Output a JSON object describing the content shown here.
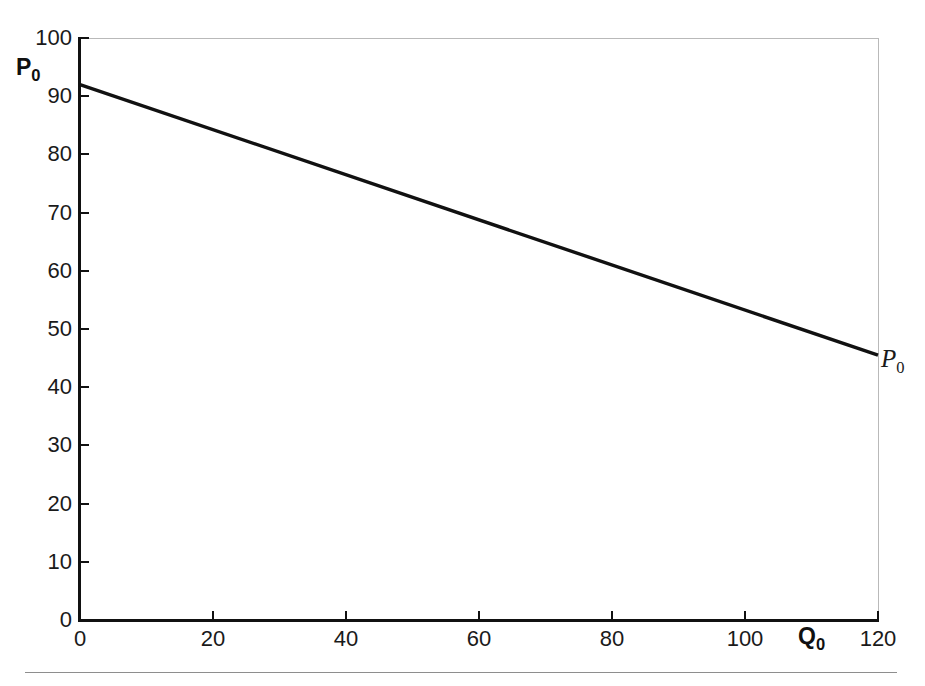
{
  "figure": {
    "background_color": "#ffffff",
    "frame_color": "#b9b9b9",
    "axis_color": "#111111",
    "curve_color": "#111111",
    "page_rule_color": "#8e8e8e"
  },
  "labels": {
    "y_axis_title_base": "P",
    "y_axis_title_sub": "0",
    "x_axis_title_base": "Q",
    "x_axis_title_sub": "0",
    "curve_label_base": "P",
    "curve_label_sub": "0"
  },
  "ticks": {
    "y": [
      "0",
      "10",
      "20",
      "30",
      "40",
      "50",
      "60",
      "70",
      "80",
      "90",
      "100"
    ],
    "x": [
      "0",
      "20",
      "40",
      "60",
      "80",
      "100",
      "120"
    ]
  },
  "chart_data": {
    "type": "line",
    "title": "",
    "subtitle": "",
    "xlabel": "Q0",
    "ylabel": "P0",
    "xlim": [
      0,
      120
    ],
    "ylim": [
      0,
      100
    ],
    "xticks": [
      0,
      20,
      40,
      60,
      80,
      100,
      120
    ],
    "yticks": [
      0,
      10,
      20,
      30,
      40,
      50,
      60,
      70,
      80,
      90,
      100
    ],
    "grid": false,
    "legend": false,
    "legend_position": "none",
    "annotations": [
      {
        "text": "P0",
        "x": 120,
        "y": 45.5,
        "style": "italic-serif",
        "placement": "right-of-line-end"
      }
    ],
    "series": [
      {
        "name": "P0",
        "label": "P0",
        "type": "line",
        "color": "#111111",
        "linewidth": 3,
        "x": [
          0,
          120
        ],
        "y": [
          92,
          45.5
        ],
        "slope": -0.3875,
        "intercept": 92,
        "description": "Downward sloping linear demand curve from (0, 92) to (120, 45.5)"
      }
    ]
  }
}
